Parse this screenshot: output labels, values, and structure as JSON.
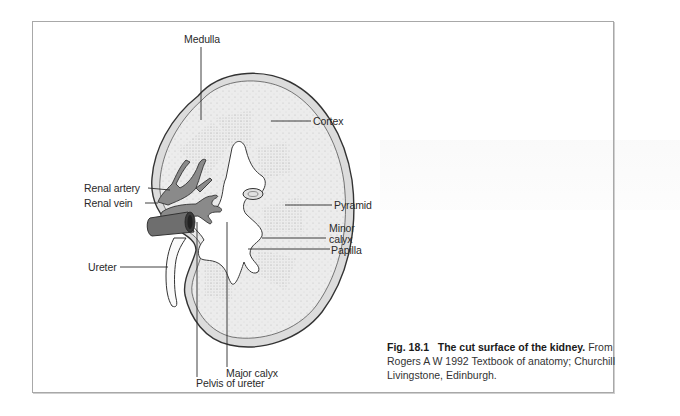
{
  "figure": {
    "labels": {
      "medulla": "Medulla",
      "cortex": "Cortex",
      "renal_artery": "Renal artery",
      "renal_vein": "Renal vein",
      "pyramid": "Pyramid",
      "minor_calyx_1": "Minor",
      "minor_calyx_2": "calyx",
      "papilla": "Papilla",
      "ureter": "Ureter",
      "major_calyx": "Major calyx",
      "pelvis_of_ureter": "Pelvis of ureter"
    },
    "caption": {
      "number": "Fig. 18.1",
      "title": "The cut surface of the kidney.",
      "source_line1": "From",
      "source_line2": "Rogers A W 1992 Textbook of anatomy; Churchill",
      "source_line3": "Livingstone, Edinburgh."
    },
    "colors": {
      "kidney_fill": "#e8e8e8",
      "vessel_fill": "#8a8a8a",
      "vein_fill": "#6e6e6e",
      "outline": "#3a3a3a",
      "frame": "#a8a8a8"
    }
  }
}
